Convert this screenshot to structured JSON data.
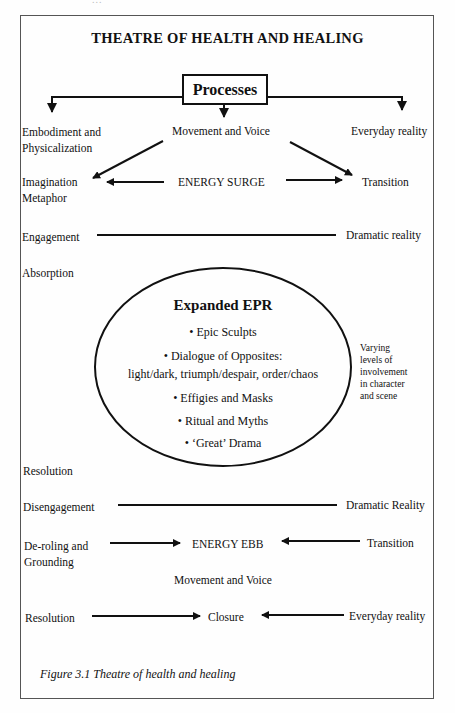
{
  "page_header_fragment": "...",
  "title": "THEATRE OF HEALTH AND HEALING",
  "processes_box": "Processes",
  "top_row": {
    "left": [
      "Embodiment and",
      "Physicalization"
    ],
    "center": "Movement and Voice",
    "right": "Everyday reality"
  },
  "surge_row": {
    "left": [
      "Imagination",
      "Metaphor"
    ],
    "center": "ENERGY SURGE",
    "right": "Transition"
  },
  "engagement_row": {
    "left": "Engagement",
    "right": "Dramatic reality"
  },
  "absorption": "Absorption",
  "epr": {
    "title": "Expanded EPR",
    "items": [
      "• Epic Sculpts",
      "• Dialogue of Opposites:",
      "light/dark, triumph/despair, order/chaos",
      "• Effigies and Masks",
      "• Ritual and Myths",
      "• ‘Great’ Drama"
    ]
  },
  "side_note": [
    "Varying",
    "levels of",
    "involvement",
    "in character",
    "and scene"
  ],
  "resolution_mid": "Resolution",
  "disengagement_row": {
    "left": "Disengagement",
    "right": "Dramatic Reality"
  },
  "ebb_row": {
    "left": [
      "De-roling and",
      "Grounding"
    ],
    "center": "ENERGY EBB",
    "right": "Transition"
  },
  "movement_voice_bottom": "Movement and Voice",
  "closure_row": {
    "left": "Resolution",
    "center": "Closure",
    "right": "Everyday reality"
  },
  "caption": "Figure 3.1 Theatre of health and healing"
}
